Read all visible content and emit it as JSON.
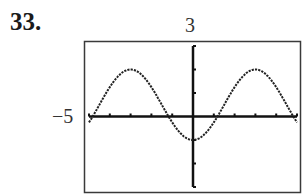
{
  "problem": {
    "number": "33."
  },
  "window_labels": {
    "ymax": "3",
    "xmin": "−5"
  },
  "colors": {
    "frame": "#3a3a3a",
    "axis": "#111111",
    "curve": "#222222"
  },
  "chart_data": {
    "type": "line",
    "title": "",
    "xlabel": "",
    "ylabel": "",
    "xlim": [
      -5,
      5
    ],
    "ylim": [
      -3,
      3
    ],
    "x_tick_step": 1,
    "y_tick_step": 1,
    "grid": false,
    "tick_labels_shown": {
      "ymax": "3",
      "xmin": "-5"
    },
    "series": [
      {
        "name": "f(x)",
        "description": "sinusoid, max 2 at x=±3, min -1 at x=0",
        "x": [
          -5,
          -4.5,
          -4,
          -3.5,
          -3,
          -2.5,
          -2,
          -1.5,
          -1,
          -0.5,
          0,
          0.5,
          1,
          1.5,
          2,
          2.5,
          3,
          3.5,
          4,
          4.5,
          5
        ],
        "values": [
          -0.25,
          0.5,
          1.25,
          1.8,
          2.0,
          1.8,
          1.25,
          0.5,
          -0.25,
          -0.8,
          -1.0,
          -0.8,
          -0.25,
          0.5,
          1.25,
          1.8,
          2.0,
          1.8,
          1.25,
          0.5,
          -0.25
        ]
      }
    ]
  }
}
